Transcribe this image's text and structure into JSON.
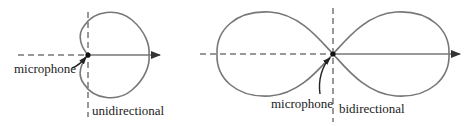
{
  "diagrams": [
    {
      "id": "unidirectional",
      "pattern_label": "unidirectional",
      "source_label": "microphone",
      "pattern_shape": "cardioid"
    },
    {
      "id": "bidirectional",
      "pattern_label": "bidirectional",
      "source_label": "microphone",
      "pattern_shape": "figure-eight"
    }
  ],
  "colors": {
    "curve": "#777777",
    "axis": "#333333",
    "text": "#222222",
    "background": "#ffffff"
  }
}
